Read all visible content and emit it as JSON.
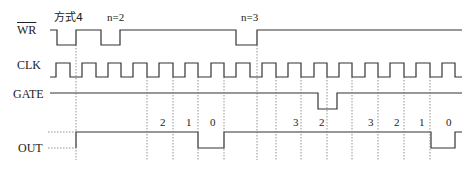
{
  "signals": {
    "wr": {
      "label": "WR",
      "overline": true
    },
    "clk": {
      "label": "CLK"
    },
    "gate": {
      "label": "GATE"
    },
    "out": {
      "label": "OUT"
    }
  },
  "annotations": {
    "mode": "方式4",
    "n1": "n=2",
    "n2": "n=3"
  },
  "counts": [
    {
      "x": 160,
      "text": "2"
    },
    {
      "x": 186,
      "text": "1"
    },
    {
      "x": 210,
      "text": "0"
    },
    {
      "x": 293,
      "text": "3"
    },
    {
      "x": 319,
      "text": "2"
    },
    {
      "x": 368,
      "text": "3"
    },
    {
      "x": 394,
      "text": "2"
    },
    {
      "x": 419,
      "text": "1"
    },
    {
      "x": 446,
      "text": "0"
    }
  ],
  "colors": {
    "line": "#333333",
    "dash": "#666666"
  }
}
